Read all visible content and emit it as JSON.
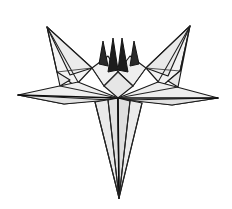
{
  "artwork": {
    "title": "Origami paper star sketch",
    "medium": "pencil line drawing",
    "subject": "folded paper five-point star",
    "caption": "",
    "canvas": {
      "width": 232,
      "height": 209,
      "background_color": "#ffffff"
    },
    "palette": {
      "background": "#ffffff",
      "outline": "#1a1a1a",
      "ink_dark": "#0d0d0d",
      "facet_light": "#f4f4f4",
      "facet_mid": "#ececec",
      "facet_shade": "#e2e2e2",
      "facet_deep": "#d8d8d8"
    },
    "geometry": {
      "center_x": 118,
      "center_y": 98,
      "left_wing_tip": [
        47,
        27
      ],
      "right_wing_tip": [
        190,
        26
      ],
      "left_point_tip": [
        18,
        95
      ],
      "right_point_tip": [
        218,
        98
      ],
      "bottom_spike_tip": [
        119,
        198
      ],
      "center_spike_top": [
        118,
        38
      ]
    },
    "facets": [
      {
        "name": "left-upper-wing",
        "points": "47,27 92,68 75,86 57,72",
        "fill": "#f3f3f3"
      },
      {
        "name": "left-upper-wing-inner",
        "points": "47,27 92,68 70,75",
        "fill": "#ececec"
      },
      {
        "name": "left-wing-lower-fold",
        "points": "47,27 57,72 70,80 60,86",
        "fill": "#e9e9e9"
      },
      {
        "name": "right-upper-wing",
        "points": "190,26 146,68 162,86 180,71",
        "fill": "#f2f2f2"
      },
      {
        "name": "right-upper-wing-inner",
        "points": "190,26 146,68 168,76",
        "fill": "#eaeaea"
      },
      {
        "name": "right-wing-lower-fold",
        "points": "190,26 180,71 168,81 178,87",
        "fill": "#e8e8e8"
      },
      {
        "name": "left-horizontal-point",
        "points": "18,95 78,82 118,98 64,104",
        "fill": "#efefef"
      },
      {
        "name": "left-horizontal-point-under",
        "points": "18,95 64,104 110,100",
        "fill": "#e2e2e2"
      },
      {
        "name": "right-horizontal-point",
        "points": "218,98 158,82 118,98 172,105",
        "fill": "#eeeeee"
      },
      {
        "name": "right-horizontal-point-under",
        "points": "218,98 172,105 126,100",
        "fill": "#e1e1e1"
      },
      {
        "name": "center-left-flap",
        "points": "92,68 108,56 118,72 104,86",
        "fill": "#f0f0f0"
      },
      {
        "name": "center-right-flap",
        "points": "146,68 130,56 118,72 133,86",
        "fill": "#efefef"
      },
      {
        "name": "center-panel",
        "points": "104,86 118,72 133,86 118,98",
        "fill": "#e6e6e6"
      },
      {
        "name": "bottom-spike-left",
        "points": "95,102 118,98 119,198",
        "fill": "#e9e9e9"
      },
      {
        "name": "bottom-spike-left-inner",
        "points": "108,100 118,98 119,198",
        "fill": "#e0e0e0"
      },
      {
        "name": "bottom-spike-right",
        "points": "142,103 118,98 119,198",
        "fill": "#ebebeb"
      },
      {
        "name": "bottom-spike-right-inner",
        "points": "130,101 118,98 119,198",
        "fill": "#dedede"
      }
    ],
    "center_spikes": [
      {
        "name": "center-spike-outer-left",
        "points": "99,64 103,41 108,66",
        "fill": "#2a2a2a"
      },
      {
        "name": "center-spike-tall-left",
        "points": "108,72 113,38 118,70",
        "fill": "#1c1c1c"
      },
      {
        "name": "center-spike-tall-right",
        "points": "118,70 122,38 128,72",
        "fill": "#1c1c1c"
      },
      {
        "name": "center-spike-outer-right",
        "points": "130,66 134,41 139,64",
        "fill": "#2a2a2a"
      }
    ],
    "creases": [
      {
        "name": "crease-left-wing-spine",
        "path": "M47,27 L78,82"
      },
      {
        "name": "crease-right-wing-spine",
        "path": "M190,26 L158,82"
      },
      {
        "name": "crease-left-point-spine",
        "path": "M18,95 L118,98"
      },
      {
        "name": "crease-right-point-spine",
        "path": "M218,98 L118,98"
      },
      {
        "name": "crease-bottom-spine",
        "path": "M118,98 L119,198"
      },
      {
        "name": "crease-bottom-left-edge",
        "path": "M95,102 L119,198"
      },
      {
        "name": "crease-bottom-right-edge",
        "path": "M142,103 L119,198"
      },
      {
        "name": "crease-bottom-left-inner",
        "path": "M108,100 L119,198"
      },
      {
        "name": "crease-bottom-right-inner",
        "path": "M130,101 L119,198"
      },
      {
        "name": "crease-center-left-fold",
        "path": "M104,86 L118,72"
      },
      {
        "name": "crease-center-right-fold",
        "path": "M133,86 L118,72"
      },
      {
        "name": "crease-left-flap-edge",
        "path": "M92,68 L104,86"
      },
      {
        "name": "crease-right-flap-edge",
        "path": "M146,68 L133,86"
      },
      {
        "name": "crease-left-belt",
        "path": "M60,86 L118,98"
      },
      {
        "name": "crease-right-belt",
        "path": "M178,87 L118,98"
      },
      {
        "name": "crease-left-wing-under",
        "path": "M57,72 L92,68"
      },
      {
        "name": "crease-right-wing-under",
        "path": "M180,71 L146,68"
      }
    ]
  }
}
